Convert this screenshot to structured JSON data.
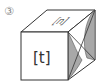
{
  "diagram": {
    "label": "③",
    "cube": {
      "front_face_text": "[t]",
      "top_face_text": "[n]",
      "right_face": "shaded curved region (gray)"
    },
    "colors": {
      "stroke": "#333333",
      "shade": "#a8a8a8",
      "face": "#ffffff",
      "label": "#888888"
    }
  }
}
